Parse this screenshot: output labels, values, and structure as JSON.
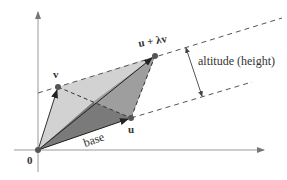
{
  "diagram": {
    "labels": {
      "origin": "0",
      "v": "v",
      "u": "u",
      "u_plus_lambda_v": "u + λv",
      "base": "base",
      "altitude": "altitude (height)"
    },
    "points": {
      "origin": [
        38,
        150
      ],
      "v": [
        58,
        87
      ],
      "u": [
        131,
        118
      ],
      "u_plus_lambda_v": [
        155,
        56
      ]
    },
    "colors": {
      "light_triangle": "#cfcfcf",
      "dark_triangle": "#8a8a8a",
      "mid_triangle": "#a3a3a3",
      "axis": "#888888",
      "dashed": "#555555",
      "vector": "#333333",
      "point": "#555555"
    }
  }
}
